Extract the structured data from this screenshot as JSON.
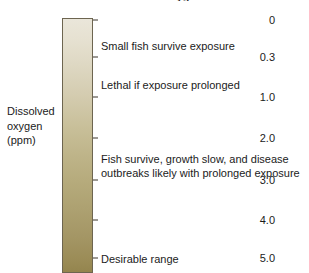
{
  "figure": {
    "title_remnant": "Dissolved oxygen",
    "axis_caption": {
      "line1": "Dissolved",
      "line2": "oxygen",
      "line3": "(ppm)"
    },
    "colors": {
      "bar_top": "#eae6da",
      "bar_mid": "#c5bb8e",
      "bar_bottom": "#94854e",
      "bar_border": "#6d6550",
      "text": "#1b1b1b",
      "background": "#ffffff"
    }
  },
  "chart_data": {
    "type": "bar",
    "title": "Dissolved oxygen",
    "subtitle": "",
    "xlabel": "",
    "ylabel": "Dissolved oxygen (ppm)",
    "orientation": "vertical-colorbar",
    "grid": false,
    "legend": "none",
    "ylim": [
      0,
      5.0
    ],
    "axis_inverted": true,
    "tick_labels": [
      "0",
      "0.3",
      "1.0",
      "2.0",
      "3.0",
      "4.0",
      "5.0"
    ],
    "tick_values": [
      0,
      0.3,
      1.0,
      2.0,
      3.0,
      4.0,
      5.0
    ],
    "tick_y_px": [
      20,
      57,
      97,
      138,
      180,
      220,
      258
    ],
    "categories": [
      "0",
      "0.3",
      "1.0",
      "2.0",
      "3.0",
      "4.0",
      "5.0"
    ],
    "values": [
      0,
      0.3,
      1.0,
      2.0,
      3.0,
      4.0,
      5.0
    ],
    "annotations": [
      {
        "text": "Small fish survive exposure",
        "range_ppm": [
          0,
          0.3
        ],
        "y_px": 39
      },
      {
        "text": "Lethal if exposure prolonged",
        "range_ppm": [
          0.3,
          1.0
        ],
        "y_px": 78
      },
      {
        "text": "Fish survive, growth slow, and disease\noutbreaks likely with prolonged exposure",
        "range_ppm": [
          1.0,
          3.0
        ],
        "y_px": 152
      },
      {
        "text": "Desirable range",
        "range_ppm": [
          4.0,
          5.0
        ],
        "y_px": 252
      }
    ]
  }
}
